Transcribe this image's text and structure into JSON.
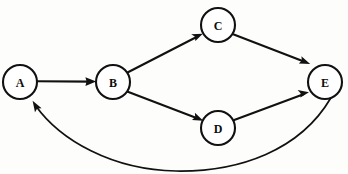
{
  "diagram": {
    "type": "directed-graph",
    "canvas": {
      "width": 348,
      "height": 174,
      "background": "#fdfdfb"
    },
    "style": {
      "node_fill": "#ffffff",
      "node_stroke": "#111111",
      "node_stroke_width": 2.1,
      "edge_color": "#111111",
      "label_color": "#0d0d0d",
      "node_radius": 17
    },
    "nodes": [
      {
        "id": "A",
        "label": "A",
        "cx": 20,
        "cy": 82,
        "r": 17
      },
      {
        "id": "B",
        "label": "B",
        "cx": 113,
        "cy": 82,
        "r": 17
      },
      {
        "id": "C",
        "label": "C",
        "cx": 218,
        "cy": 25,
        "r": 17
      },
      {
        "id": "D",
        "label": "D",
        "cx": 218,
        "cy": 128,
        "r": 17
      },
      {
        "id": "E",
        "label": "E",
        "cx": 325,
        "cy": 82,
        "r": 17
      }
    ],
    "edges": [
      {
        "id": "a-to-b",
        "from": "A",
        "to": "B",
        "shape": "straight",
        "directed": true
      },
      {
        "id": "b-to-c",
        "from": "B",
        "to": "C",
        "shape": "straight",
        "directed": true
      },
      {
        "id": "b-to-d",
        "from": "B",
        "to": "D",
        "shape": "straight",
        "directed": true
      },
      {
        "id": "c-to-e",
        "from": "C",
        "to": "E",
        "shape": "straight",
        "directed": true
      },
      {
        "id": "d-to-e",
        "from": "D",
        "to": "E",
        "shape": "straight",
        "directed": true
      },
      {
        "id": "e-to-a",
        "from": "E",
        "to": "A",
        "shape": "curved",
        "directed": true
      }
    ]
  }
}
